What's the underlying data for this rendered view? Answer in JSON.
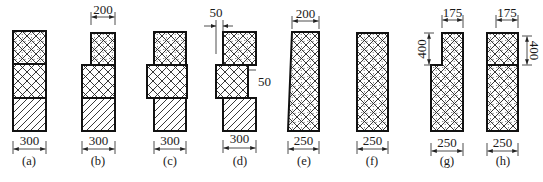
{
  "figure": {
    "colors": {
      "ink": "#111111",
      "background": "#ffffff"
    },
    "patterns": {
      "dotted-crosshatch": "concrete-like fill: diagonal cross-hatch with dots",
      "crosshatch": "diagonal cross-hatch",
      "diagonal-hatch": "single diagonal hatch"
    },
    "panels": [
      {
        "id": "a",
        "caption": "(a)",
        "blocks": [
          {
            "x": 13,
            "y": 31,
            "w": 33,
            "h": 33,
            "pattern": "dotted"
          },
          {
            "x": 13,
            "y": 64,
            "w": 33,
            "h": 34,
            "pattern": "cross"
          },
          {
            "x": 13,
            "y": 98,
            "w": 33,
            "h": 33,
            "pattern": "diag"
          }
        ],
        "dims": [
          {
            "type": "h",
            "x1": 13,
            "x2": 46,
            "y": 149,
            "label": "300",
            "label_y": 145
          }
        ],
        "caption_x": 29
      },
      {
        "id": "b",
        "caption": "(b)",
        "blocks": [
          {
            "x": 91,
            "y": 33,
            "w": 24,
            "h": 32,
            "pattern": "dotted"
          },
          {
            "x": 82,
            "y": 65,
            "w": 33,
            "h": 33,
            "pattern": "cross"
          },
          {
            "x": 82,
            "y": 98,
            "w": 33,
            "h": 33,
            "pattern": "diag"
          }
        ],
        "dims": [
          {
            "type": "h",
            "x1": 91,
            "x2": 115,
            "y": 17,
            "label": "200",
            "label_y": 14
          },
          {
            "type": "h",
            "x1": 82,
            "x2": 115,
            "y": 149,
            "label": "300",
            "label_y": 145
          }
        ],
        "caption_x": 98
      },
      {
        "id": "c",
        "caption": "(c)",
        "blocks": [
          {
            "x": 154,
            "y": 32,
            "w": 32,
            "h": 33,
            "pattern": "dotted"
          },
          {
            "x": 147,
            "y": 65,
            "w": 40,
            "h": 33,
            "pattern": "cross"
          },
          {
            "x": 154,
            "y": 98,
            "w": 32,
            "h": 33,
            "pattern": "diag"
          }
        ],
        "dims": [
          {
            "type": "h",
            "x1": 154,
            "x2": 186,
            "y": 149,
            "label": "300",
            "label_y": 145
          }
        ],
        "caption_x": 170
      },
      {
        "id": "d",
        "caption": "(d)",
        "blocks": [
          {
            "x": 223,
            "y": 32,
            "w": 33,
            "h": 33,
            "pattern": "dotted"
          },
          {
            "x": 216,
            "y": 65,
            "w": 32,
            "h": 33,
            "pattern": "cross"
          },
          {
            "x": 223,
            "y": 98,
            "w": 33,
            "h": 33,
            "pattern": "diag"
          }
        ],
        "dims": [
          {
            "type": "offset-top",
            "x1": 216,
            "x2": 223,
            "y": 26,
            "label": "50",
            "label_x": 216,
            "label_y": 17
          },
          {
            "type": "offset-right",
            "x1": 248,
            "x2": 256,
            "y": 70,
            "label": "50",
            "label_x": 258,
            "label_y": 86
          },
          {
            "type": "h",
            "x1": 223,
            "x2": 256,
            "y": 148,
            "label": "300",
            "label_y": 143
          }
        ],
        "caption_x": 240
      },
      {
        "id": "e",
        "caption": "(e)",
        "shape": "trapezoid",
        "points": [
          [
            292,
            32
          ],
          [
            319,
            32
          ],
          [
            319,
            131
          ],
          [
            288,
            131
          ]
        ],
        "pattern": "dotted",
        "dims": [
          {
            "type": "h",
            "x1": 292,
            "x2": 319,
            "y": 21,
            "label": "200",
            "label_y": 18
          },
          {
            "type": "h",
            "x1": 288,
            "x2": 319,
            "y": 149,
            "label": "250",
            "label_y": 145
          }
        ],
        "caption_x": 304
      },
      {
        "id": "f",
        "caption": "(f)",
        "blocks": [
          {
            "x": 357,
            "y": 33,
            "w": 31,
            "h": 98,
            "pattern": "dotted"
          }
        ],
        "dims": [
          {
            "type": "h",
            "x1": 357,
            "x2": 388,
            "y": 149,
            "label": "250",
            "label_y": 145
          }
        ],
        "caption_x": 372
      },
      {
        "id": "g",
        "caption": "(g)",
        "shape": "notched",
        "points": [
          [
            442,
            33
          ],
          [
            463,
            33
          ],
          [
            463,
            131
          ],
          [
            431,
            131
          ],
          [
            431,
            65
          ],
          [
            442,
            65
          ]
        ],
        "pattern": "dotted",
        "dims": [
          {
            "type": "h",
            "x1": 442,
            "x2": 463,
            "y": 20,
            "label": "175",
            "label_y": 17
          },
          {
            "type": "v",
            "x": 429,
            "y1": 33,
            "y2": 65,
            "label": "400",
            "label_x": 423
          },
          {
            "type": "h",
            "x1": 431,
            "x2": 463,
            "y": 151,
            "label": "250",
            "label_y": 147
          }
        ],
        "caption_x": 447
      },
      {
        "id": "h",
        "caption": "(h)",
        "blocks": [
          {
            "x": 487,
            "y": 33,
            "w": 31,
            "h": 32,
            "pattern": "dotted"
          },
          {
            "x": 487,
            "y": 65,
            "w": 31,
            "h": 66,
            "pattern": "dotted"
          }
        ],
        "dims": [
          {
            "type": "h",
            "x1": 496,
            "x2": 518,
            "y": 20,
            "label": "175",
            "label_y": 17
          },
          {
            "type": "v",
            "x": 527,
            "y1": 36,
            "y2": 65,
            "label": "400",
            "label_x": 533
          },
          {
            "type": "h",
            "x1": 487,
            "x2": 518,
            "y": 151,
            "label": "250",
            "label_y": 147
          }
        ],
        "caption_x": 503
      }
    ],
    "caption_y": 165
  }
}
